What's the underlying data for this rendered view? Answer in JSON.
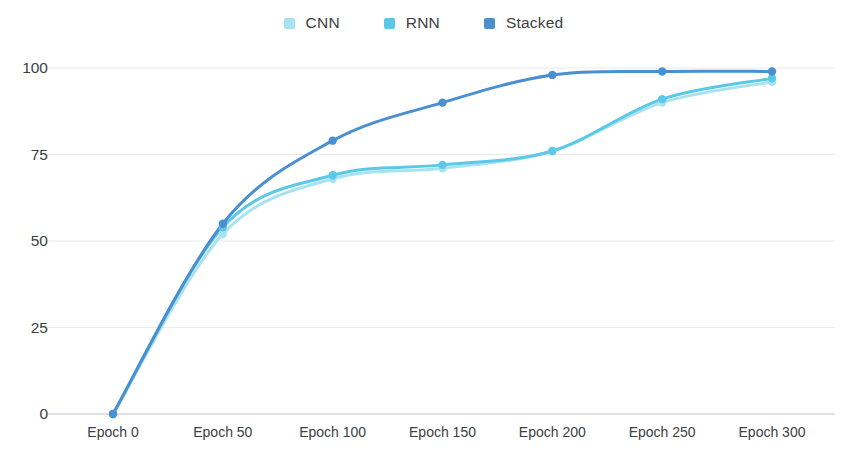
{
  "chart_data": {
    "type": "line",
    "title": "",
    "subtitle": "",
    "xlabel": "",
    "ylabel": "",
    "x": [
      0,
      50,
      100,
      150,
      200,
      250,
      300
    ],
    "categories": [
      "Epoch 0",
      "Epoch 50",
      "Epoch 100",
      "Epoch 150",
      "Epoch 200",
      "Epoch 250",
      "Epoch 300"
    ],
    "series": [
      {
        "name": "CNN",
        "color": "#a7e3ef",
        "values": [
          0,
          52,
          68,
          71,
          76,
          90,
          96
        ]
      },
      {
        "name": "RNN",
        "color": "#5cc8e8",
        "values": [
          0,
          54,
          69,
          72,
          76,
          91,
          97
        ]
      },
      {
        "name": "Stacked",
        "color": "#4a8fd0",
        "values": [
          0,
          55,
          79,
          90,
          98,
          99,
          99
        ]
      }
    ],
    "ylim": [
      0,
      100
    ],
    "yticks": [
      0,
      25,
      50,
      75,
      100
    ],
    "ytick_labels": [
      "0",
      "25",
      "50",
      "75",
      "100"
    ],
    "xtick_labels": [
      "Epoch 0",
      "Epoch 50",
      "Epoch 100",
      "Epoch 150",
      "Epoch 200",
      "Epoch 250",
      "Epoch 300"
    ],
    "grid": {
      "horizontal": true,
      "vertical": false,
      "color": "#e8eaed"
    },
    "legend": {
      "position": "top-center",
      "entries": [
        "CNN",
        "RNN",
        "Stacked"
      ]
    },
    "markers": "circle",
    "line_width": 3
  },
  "legend": {
    "items": [
      {
        "label": "CNN",
        "color": "#a7e3ef",
        "icon": "legend-swatch-square"
      },
      {
        "label": "RNN",
        "color": "#5cc8e8",
        "icon": "legend-swatch-square"
      },
      {
        "label": "Stacked",
        "color": "#4a8fd0",
        "icon": "legend-swatch-square"
      }
    ]
  },
  "axes": {
    "y_labels": [
      "100",
      "75",
      "50",
      "25",
      "0"
    ],
    "x_labels": [
      "Epoch 0",
      "Epoch 50",
      "Epoch 100",
      "Epoch 150",
      "Epoch 200",
      "Epoch 250",
      "Epoch 300"
    ]
  },
  "footer": {
    "cropped_text": ""
  },
  "colors": {
    "cnn": "#a7e3ef",
    "rnn": "#5cc8e8",
    "stacked": "#4a8fd0",
    "grid": "#e8eaed",
    "axis_text": "#3c4043",
    "background": "#ffffff"
  }
}
